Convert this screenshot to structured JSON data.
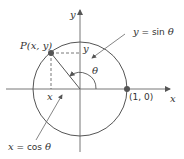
{
  "diagram": {
    "axes": {
      "x_label": "x",
      "y_label": "y"
    },
    "point_label": "P(x, y)",
    "point_on_axis_label": "(1, 0)",
    "angle_label": "θ",
    "projection_x_label": "x",
    "projection_y_label": "y",
    "sin_label_var": "y",
    "sin_label_eq": " = sin ",
    "sin_label_theta": "θ",
    "cos_label_var": "x",
    "cos_label_eq": " = cos ",
    "cos_label_theta": "θ",
    "colors": {
      "line": "#555555",
      "point": "#555555",
      "text": "#333333",
      "background": "#ffffff"
    }
  }
}
